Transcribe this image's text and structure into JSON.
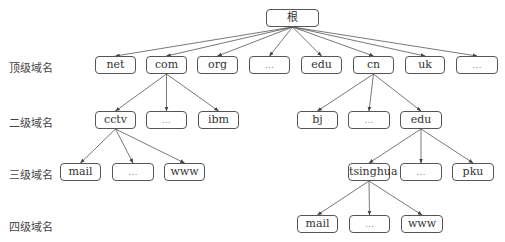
{
  "diagram": {
    "levels": [
      {
        "label": "顶级域名",
        "y": 59
      },
      {
        "label": "二级域名",
        "y": 114
      },
      {
        "label": "三级域名",
        "y": 166
      },
      {
        "label": "四级域名",
        "y": 218
      }
    ],
    "nodes": {
      "root": {
        "label": "根",
        "x": 266,
        "y": 9,
        "w": 51
      },
      "net": {
        "label": "net",
        "x": 95,
        "y": 56,
        "w": 39
      },
      "com": {
        "label": "com",
        "x": 146,
        "y": 56,
        "w": 39
      },
      "org": {
        "label": "org",
        "x": 197,
        "y": 56,
        "w": 39
      },
      "tld_more": {
        "label": "…",
        "x": 249,
        "y": 56,
        "w": 39
      },
      "edu": {
        "label": "edu",
        "x": 301,
        "y": 56,
        "w": 39
      },
      "cn": {
        "label": "cn",
        "x": 353,
        "y": 56,
        "w": 39
      },
      "uk": {
        "label": "uk",
        "x": 405,
        "y": 56,
        "w": 38
      },
      "tld_more2": {
        "label": "…",
        "x": 456,
        "y": 56,
        "w": 40
      },
      "cctv": {
        "label": "cctv",
        "x": 95,
        "y": 111,
        "w": 39
      },
      "com_more": {
        "label": "…",
        "x": 146,
        "y": 111,
        "w": 39
      },
      "ibm": {
        "label": "ibm",
        "x": 198,
        "y": 111,
        "w": 39
      },
      "bj": {
        "label": "bj",
        "x": 297,
        "y": 111,
        "w": 39
      },
      "cn_more": {
        "label": "…",
        "x": 348,
        "y": 111,
        "w": 40
      },
      "cn_edu": {
        "label": "edu",
        "x": 400,
        "y": 111,
        "w": 40
      },
      "cctv_mail": {
        "label": "mail",
        "x": 60,
        "y": 163,
        "w": 39
      },
      "cctv_more": {
        "label": "…",
        "x": 112,
        "y": 163,
        "w": 40
      },
      "cctv_www": {
        "label": "www",
        "x": 164,
        "y": 163,
        "w": 39
      },
      "tsinghua": {
        "label": "tsinghua",
        "x": 348,
        "y": 163,
        "w": 40
      },
      "edu_more": {
        "label": "…",
        "x": 400,
        "y": 163,
        "w": 40
      },
      "pku": {
        "label": "pku",
        "x": 452,
        "y": 163,
        "w": 40
      },
      "ts_mail": {
        "label": "mail",
        "x": 297,
        "y": 215,
        "w": 39
      },
      "ts_more": {
        "label": "…",
        "x": 349,
        "y": 215,
        "w": 39
      },
      "ts_www": {
        "label": "www",
        "x": 401,
        "y": 215,
        "w": 40
      }
    },
    "edges": [
      [
        "root",
        "net"
      ],
      [
        "root",
        "com"
      ],
      [
        "root",
        "org"
      ],
      [
        "root",
        "tld_more"
      ],
      [
        "root",
        "edu"
      ],
      [
        "root",
        "cn"
      ],
      [
        "root",
        "uk"
      ],
      [
        "root",
        "tld_more2"
      ],
      [
        "com",
        "cctv"
      ],
      [
        "com",
        "com_more"
      ],
      [
        "com",
        "ibm"
      ],
      [
        "cn",
        "bj"
      ],
      [
        "cn",
        "cn_more"
      ],
      [
        "cn",
        "cn_edu"
      ],
      [
        "cctv",
        "cctv_mail"
      ],
      [
        "cctv",
        "cctv_more"
      ],
      [
        "cctv",
        "cctv_www"
      ],
      [
        "cn_edu",
        "tsinghua"
      ],
      [
        "cn_edu",
        "edu_more"
      ],
      [
        "cn_edu",
        "pku"
      ],
      [
        "tsinghua",
        "ts_mail"
      ],
      [
        "tsinghua",
        "ts_more"
      ],
      [
        "tsinghua",
        "ts_www"
      ]
    ]
  }
}
